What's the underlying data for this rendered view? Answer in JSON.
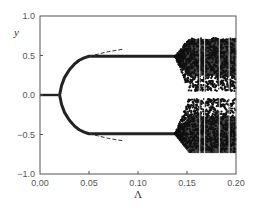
{
  "chart_data": {
    "type": "scatter",
    "title": "",
    "xlabel": "Λ",
    "ylabel": "y",
    "xlim": [
      0.0,
      0.2
    ],
    "ylim": [
      -1.0,
      1.0
    ],
    "grid": false,
    "legend": null,
    "x_ticks": [
      "0.00",
      "0.05",
      "0.10",
      "0.15",
      "0.20"
    ],
    "y_ticks": [
      "1.0",
      "0.5",
      "0.0",
      "−0.5",
      "−1.0"
    ],
    "series": [
      {
        "name": "fixed point (y=0)",
        "style": "dots",
        "x": [
          0.0,
          0.005,
          0.01,
          0.015,
          0.019
        ],
        "y": [
          0.0,
          0.0,
          0.0,
          0.0,
          0.0
        ]
      },
      {
        "name": "upper branch",
        "style": "dots",
        "x": [
          0.02,
          0.022,
          0.025,
          0.03,
          0.035,
          0.04,
          0.045,
          0.05,
          0.075,
          0.1,
          0.125,
          0.138
        ],
        "y": [
          0.0,
          0.12,
          0.22,
          0.32,
          0.39,
          0.44,
          0.47,
          0.49,
          0.49,
          0.49,
          0.49,
          0.49
        ]
      },
      {
        "name": "lower branch",
        "style": "dots",
        "x": [
          0.02,
          0.022,
          0.025,
          0.03,
          0.035,
          0.04,
          0.045,
          0.05,
          0.075,
          0.1,
          0.125,
          0.138
        ],
        "y": [
          0.0,
          -0.12,
          -0.22,
          -0.32,
          -0.39,
          -0.44,
          -0.47,
          -0.49,
          -0.49,
          -0.49,
          -0.49,
          -0.49
        ]
      },
      {
        "name": "analytic approximation (dashed)",
        "style": "dashed",
        "x": [
          0.05,
          0.06,
          0.07,
          0.08,
          0.085
        ],
        "y_upper": [
          0.49,
          0.52,
          0.55,
          0.57,
          0.58
        ],
        "y_lower": [
          -0.49,
          -0.52,
          -0.55,
          -0.57,
          -0.58
        ]
      },
      {
        "name": "chaotic band",
        "style": "dense dots",
        "x_range": [
          0.138,
          0.2
        ],
        "upper_band": {
          "min": 0.05,
          "max": 0.72
        },
        "lower_band": {
          "min": -0.72,
          "max": -0.05
        }
      }
    ]
  }
}
